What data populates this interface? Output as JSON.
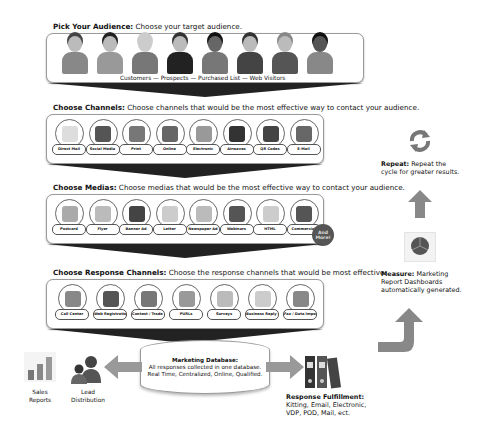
{
  "audience": {
    "heading": "Pick Your Audience:",
    "description": "Choose your target audience.",
    "caption": "Customers — Prospects — Purchased List — Web Visitors",
    "people": [
      {
        "hair": "#444",
        "skin": "#bbb",
        "shirt": "#888"
      },
      {
        "hair": "#222",
        "skin": "#bbb",
        "shirt": "#999"
      },
      {
        "hair": "#ccc",
        "skin": "#ccc",
        "shirt": "#777"
      },
      {
        "hair": "#333",
        "skin": "#bbb",
        "shirt": "#222"
      },
      {
        "hair": "#111",
        "skin": "#666",
        "shirt": "#777"
      },
      {
        "hair": "#333",
        "skin": "#bbb",
        "shirt": "#444"
      },
      {
        "hair": "#888",
        "skin": "#bbb",
        "shirt": "#555"
      },
      {
        "hair": "#111",
        "skin": "#555",
        "shirt": "#888"
      }
    ]
  },
  "channels": {
    "heading": "Choose Channels:",
    "description": "Choose channels that would be the most effective way to contact your audience.",
    "items": [
      {
        "label": "Direct Mail",
        "icon": "envelope-icon",
        "color": "#ddd"
      },
      {
        "label": "Social Media",
        "icon": "social-icon",
        "color": "#555"
      },
      {
        "label": "Print",
        "icon": "print-icon",
        "color": "#777"
      },
      {
        "label": "Online",
        "icon": "online-icon",
        "color": "#666"
      },
      {
        "label": "Electronic",
        "icon": "phone-icon",
        "color": "#999"
      },
      {
        "label": "Airwaves",
        "icon": "microphone-icon",
        "color": "#333"
      },
      {
        "label": "QR Codes",
        "icon": "qr-code-icon",
        "color": "#444"
      },
      {
        "label": "E-Mail",
        "icon": "email-icon",
        "color": "#666"
      }
    ]
  },
  "medias": {
    "heading": "Choose Medias:",
    "description": "Choose medias that would be the most effective way to contact your audience.",
    "items": [
      {
        "label": "Postcard",
        "icon": "postcard-icon",
        "color": "#aaa"
      },
      {
        "label": "Flyer",
        "icon": "flyer-icon",
        "color": "#bbb"
      },
      {
        "label": "Banner Ad",
        "icon": "banner-ad-icon",
        "color": "#444"
      },
      {
        "label": "Letter",
        "icon": "letter-icon",
        "color": "#ccc"
      },
      {
        "label": "Newspaper Ad",
        "icon": "newspaper-icon",
        "color": "#bbb"
      },
      {
        "label": "Webinars",
        "icon": "chat-bubble-icon",
        "color": "#555"
      },
      {
        "label": "HTML",
        "icon": "html-doc-icon",
        "color": "#ccc"
      },
      {
        "label": "Commercial",
        "icon": "speech-icon",
        "color": "#555"
      }
    ],
    "badge": "And More!"
  },
  "response": {
    "heading": "Choose Response Channels:",
    "description": "Choose the response channels that would be most effective.",
    "items": [
      {
        "label": "Call Center",
        "icon": "phone-icon",
        "color": "#888"
      },
      {
        "label": "Web Registration",
        "icon": "web-icon",
        "color": "#555"
      },
      {
        "label": "Contest / Trade Show",
        "icon": "star-icon",
        "color": "#777"
      },
      {
        "label": "PURLs",
        "icon": "purl-icon",
        "color": "#999"
      },
      {
        "label": "Surveys",
        "icon": "survey-icon",
        "color": "#bbb"
      },
      {
        "label": "Business Reply Card",
        "icon": "reply-card-icon",
        "color": "#ccc"
      },
      {
        "label": "Fax / Data Import",
        "icon": "fax-icon",
        "color": "#888"
      }
    ]
  },
  "database": {
    "title": "Marketing Database:",
    "line1": "All responses collected in one database.",
    "line2": "Real Time, Centralized, Online, Qualified."
  },
  "sales_reports": {
    "line1": "Sales",
    "line2": "Reports"
  },
  "lead_distribution": {
    "line1": "Lead",
    "line2": "Distribution"
  },
  "fulfillment": {
    "title": "Response Fulfillment:",
    "line1": "Kitting, Email, Electronic,",
    "line2": "VDP, POD, Mail, ect."
  },
  "repeat": {
    "heading": "Repeat:",
    "line1": "Repeat the",
    "line2": "cycle for greater results."
  },
  "measure": {
    "heading": "Measure:",
    "line1": "Marketing",
    "line2": "Report Dashboards",
    "line3": "automatically generated."
  }
}
